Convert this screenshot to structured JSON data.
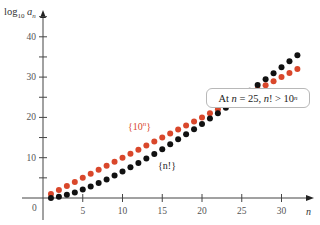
{
  "chart_data": {
    "type": "scatter",
    "title": "",
    "xlabel": "n",
    "ylabel": "log10 a_n",
    "xlim": [
      0,
      32
    ],
    "ylim": [
      0,
      45
    ],
    "x_ticks": [
      5,
      10,
      15,
      20,
      25,
      30
    ],
    "y_ticks": [
      10,
      20,
      30,
      40
    ],
    "origin_label": "0",
    "grid": false,
    "annotation": "At n = 25, n! > 10^n",
    "series": [
      {
        "name": "{10^n}",
        "color": "#d9472b",
        "x": [
          1,
          2,
          3,
          4,
          5,
          6,
          7,
          8,
          9,
          10,
          11,
          12,
          13,
          14,
          15,
          16,
          17,
          18,
          19,
          20,
          21,
          22,
          23,
          24,
          25,
          26,
          27,
          28,
          29,
          30,
          31,
          32
        ],
        "values": [
          1,
          2,
          3,
          4,
          5,
          6,
          7,
          8,
          9,
          10,
          11,
          12,
          13,
          14,
          15,
          16,
          17,
          18,
          19,
          20,
          21,
          22,
          23,
          24,
          25,
          26,
          27,
          28,
          29,
          30,
          31,
          32
        ]
      },
      {
        "name": "{n!}",
        "color": "#111111",
        "x": [
          1,
          2,
          3,
          4,
          5,
          6,
          7,
          8,
          9,
          10,
          11,
          12,
          13,
          14,
          15,
          16,
          17,
          18,
          19,
          20,
          21,
          22,
          23,
          24,
          25,
          26,
          27,
          28,
          29,
          30,
          31,
          32
        ],
        "values": [
          0,
          0.301,
          0.778,
          1.38,
          2.079,
          2.857,
          3.702,
          4.606,
          5.56,
          6.56,
          7.601,
          8.68,
          9.794,
          10.94,
          12.116,
          13.321,
          14.551,
          15.806,
          17.085,
          18.386,
          19.709,
          21.052,
          22.414,
          23.795,
          25.19,
          26.606,
          28.036,
          29.484,
          30.946,
          32.423,
          33.915,
          35.421
        ]
      }
    ]
  },
  "labels": {
    "y_axis": "log",
    "y_axis_sub": "10",
    "y_axis_var": "a",
    "y_axis_var_sub": "n",
    "x_axis": "n",
    "origin": "0",
    "series_red": "{10",
    "series_red_sup": "n",
    "series_red_end": "}",
    "series_black": "{n!}",
    "annot_pre": "At ",
    "annot_n": "n",
    "annot_mid": " = 25, ",
    "annot_fact": "n",
    "annot_gt": "! > 10",
    "annot_sup": "n"
  }
}
